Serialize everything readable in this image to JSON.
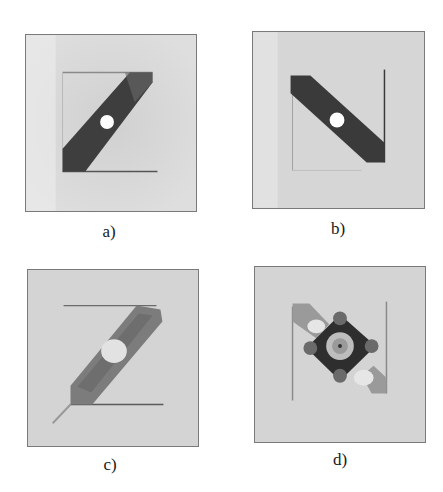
{
  "figure": {
    "panels": [
      {
        "id": "a",
        "label": "a)",
        "description": "Z-shaped antenna with dark diagonal strip and white feed hole"
      },
      {
        "id": "b",
        "label": "b)",
        "description": "N-shaped antenna with dark diagonal strip and white feed hole"
      },
      {
        "id": "c",
        "label": "c)",
        "description": "Z-shaped antenna with soldered lighter diagonal strip"
      },
      {
        "id": "d",
        "label": "d)",
        "description": "N-shaped antenna with mounted SMA connector"
      }
    ],
    "colors": {
      "background": "#ffffff",
      "substrate": "#d4d4d4",
      "strip": "#3c3c3c",
      "border": "#7a7a7a"
    }
  }
}
